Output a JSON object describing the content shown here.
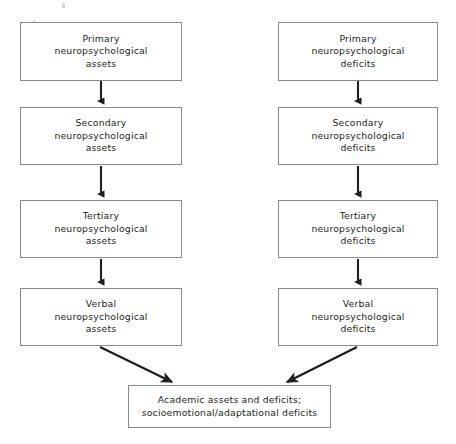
{
  "figure": {
    "background_color": "#ffffff",
    "box_border_color": "#8a8a8a",
    "text_color": "#231f20",
    "arrow_color": "#231f20"
  },
  "left_column": {
    "label": "assets-chain",
    "nodes": [
      {
        "id": "primary-assets",
        "text": "Primary\nneuropsychological\nassets"
      },
      {
        "id": "secondary-assets",
        "text": "Secondary\nneuropsychological\nassets"
      },
      {
        "id": "tertiary-assets",
        "text": "Tertiary\nneuropsychological\nassets"
      },
      {
        "id": "verbal-assets",
        "text": "Verbal\nneuropsychological\nassets"
      }
    ]
  },
  "right_column": {
    "label": "deficits-chain",
    "nodes": [
      {
        "id": "primary-deficits",
        "text": "Primary\nneuropsychological\ndeficits"
      },
      {
        "id": "secondary-deficits",
        "text": "Secondary\nneuropsychological\ndeficits"
      },
      {
        "id": "tertiary-deficits",
        "text": "Tertiary\nneuropsychological\ndeficits"
      },
      {
        "id": "verbal-deficits",
        "text": "Verbal\nneuropsychological\ndeficits"
      }
    ]
  },
  "outcome": {
    "id": "academic-outcome",
    "text": "Academic assets and deficits;\nsocioemotional/adaptational deficits"
  },
  "connectors": [
    {
      "id": "arrow-left-1-2",
      "from": "primary-assets",
      "to": "secondary-assets",
      "kind": "vertical-arrow"
    },
    {
      "id": "arrow-left-2-3",
      "from": "secondary-assets",
      "to": "tertiary-assets",
      "kind": "vertical-arrow"
    },
    {
      "id": "arrow-left-3-4",
      "from": "tertiary-assets",
      "to": "verbal-assets",
      "kind": "vertical-arrow"
    },
    {
      "id": "arrow-right-1-2",
      "from": "primary-deficits",
      "to": "secondary-deficits",
      "kind": "vertical-arrow"
    },
    {
      "id": "arrow-right-2-3",
      "from": "secondary-deficits",
      "to": "tertiary-deficits",
      "kind": "vertical-arrow"
    },
    {
      "id": "arrow-right-3-4",
      "from": "tertiary-deficits",
      "to": "verbal-deficits",
      "kind": "vertical-arrow"
    },
    {
      "id": "arrow-assets-outcome",
      "from": "verbal-assets",
      "to": "academic-outcome",
      "kind": "diagonal-arrow"
    },
    {
      "id": "arrow-deficits-outcome",
      "from": "verbal-deficits",
      "to": "academic-outcome",
      "kind": "diagonal-arrow"
    }
  ]
}
